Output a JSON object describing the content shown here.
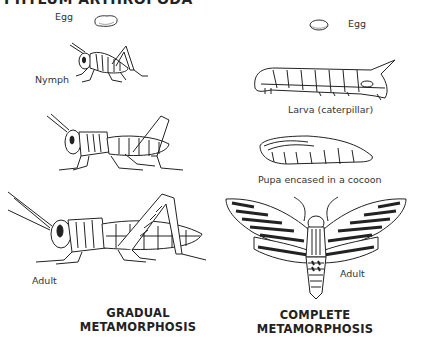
{
  "page_title": "PHYLUM ARTHROPODA",
  "gradual": {
    "heading_line1": "GRADUAL",
    "heading_line2": "METAMORPHOSIS",
    "stages": [
      {
        "label": "Egg",
        "icon": "grasshopper-egg-icon"
      },
      {
        "label": "Nymph",
        "icon": "grasshopper-nymph-icon"
      },
      {
        "label": "",
        "icon": "grasshopper-older-nymph-icon"
      },
      {
        "label": "Adult",
        "icon": "grasshopper-adult-icon"
      }
    ]
  },
  "complete": {
    "heading_line1": "COMPLETE",
    "heading_line2": "METAMORPHOSIS",
    "stages": [
      {
        "label": "Egg",
        "icon": "moth-egg-icon"
      },
      {
        "label": "Larva (caterpillar)",
        "icon": "caterpillar-icon"
      },
      {
        "label": "Pupa encased in a cocoon",
        "icon": "cocoon-icon"
      },
      {
        "label": "Adult",
        "icon": "moth-adult-icon"
      }
    ]
  }
}
